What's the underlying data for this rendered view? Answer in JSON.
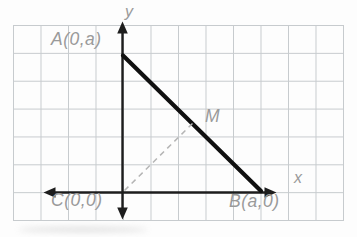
{
  "figure": {
    "labels": {
      "y_axis": "y",
      "x_axis": "x",
      "point_a": "A(0,a)",
      "point_b": "B(a,0)",
      "point_c": "C(0,0)",
      "point_m": "M"
    },
    "geometry": {
      "grid_cols": 12,
      "grid_rows": 7,
      "triangle": {
        "A": "on y-axis, 5 grid cells above origin",
        "B": "on x-axis, 5 grid cells right of origin",
        "C": "origin (0,0)"
      },
      "M": "midpoint of hypotenuse AB, connected to C by dashed segment",
      "axes": "x-axis and y-axis each drawn with arrowheads at both ends"
    },
    "colors": {
      "background": "#fdfdfd",
      "grid": "#c7cbce",
      "axis": "#1d1d1d",
      "triangle_hypotenuse": "#101010",
      "dashed_median": "#b5b5b5",
      "label_text": "#9a9a9a"
    }
  }
}
